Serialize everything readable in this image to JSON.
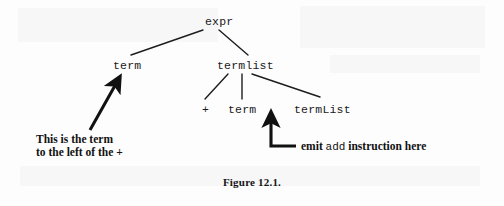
{
  "figure": {
    "caption": "Figure 12.1.",
    "background_color": "#fdfdfd",
    "ink_color": "#1a1a1a"
  },
  "tree": {
    "nodes": [
      {
        "id": "expr",
        "label": "expr",
        "level": 0,
        "x": 205,
        "y": 22
      },
      {
        "id": "term1",
        "label": "term",
        "level": 1,
        "x": 113,
        "y": 66
      },
      {
        "id": "termlist",
        "label": "termlist",
        "level": 1,
        "x": 217,
        "y": 66
      },
      {
        "id": "plus",
        "label": "+",
        "level": 2,
        "x": 199,
        "y": 110
      },
      {
        "id": "term2",
        "label": "term",
        "level": 2,
        "x": 231,
        "y": 110
      },
      {
        "id": "termList2",
        "label": "termList",
        "level": 2,
        "x": 296,
        "y": 110
      }
    ],
    "edges": [
      {
        "from": "expr",
        "to": "term1"
      },
      {
        "from": "expr",
        "to": "termlist"
      },
      {
        "from": "termlist",
        "to": "plus"
      },
      {
        "from": "termlist",
        "to": "term2"
      },
      {
        "from": "termlist",
        "to": "termList2"
      }
    ]
  },
  "annotations": [
    {
      "id": "left-callout",
      "target_node": "term1",
      "arrow_type": "diagonal-arrow-up-right",
      "line1": "This is the term",
      "line2": "to the left of the +"
    },
    {
      "id": "right-callout",
      "target_node": "term2",
      "arrow_type": "elbow-arrow-up",
      "text_before": "emit",
      "text_mono": "add",
      "text_after": "instruction here"
    }
  ]
}
